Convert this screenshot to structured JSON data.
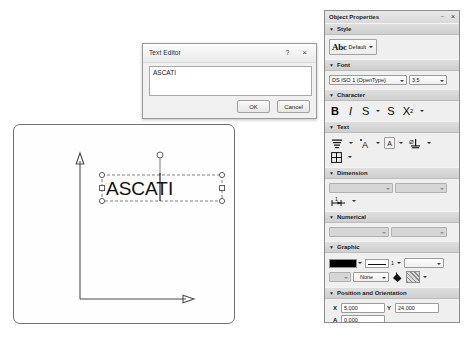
{
  "canvas": {
    "name": "drawing-canvas",
    "text_object": "ASCATI",
    "axis_x_label": "",
    "axis_y_label": "",
    "selection": "text-selection-box"
  },
  "dialog": {
    "title": "Text Editor",
    "help_label": "?",
    "close_label": "×",
    "text_value": "ASCATI",
    "placeholder": "",
    "ok_label": "OK",
    "cancel_label": "Cancel"
  },
  "panel": {
    "title": "Object Properties",
    "pin_label": "–",
    "close_label": "×",
    "sections": {
      "style": {
        "label": "Style",
        "triangle": "▼",
        "preview_glyph": "Abc",
        "value": "Default"
      },
      "font": {
        "label": "Font",
        "triangle": "▼",
        "family": "DS ISO 1 (OpenType)",
        "size": "3.5"
      },
      "character": {
        "label": "Character",
        "triangle": "▼",
        "bold": "B",
        "italic": "I",
        "strike": "S",
        "underline": "S",
        "superscript_base": "X",
        "superscript_exp": "2"
      },
      "text": {
        "label": "Text",
        "triangle": "▼",
        "align_icon": "text-align-icon",
        "letter_a1": "A",
        "letter_a2": "A",
        "anchor_icon": "text-anchor-icon",
        "table_icon": "text-grid-icon"
      },
      "dimension": {
        "label": "Dimension",
        "triangle": "▼",
        "combo1": "",
        "combo2": "",
        "tool_icon": "dimension-style-icon"
      },
      "numerical": {
        "label": "Numerical",
        "triangle": "▼",
        "combo1": "",
        "combo2": ""
      },
      "graphic": {
        "label": "Graphic",
        "triangle": "▼",
        "color": "#000000",
        "line_width": "1",
        "line_style": "",
        "pattern_combo": "",
        "fill_value": "None",
        "hatch": "hatch-pattern-swatch"
      },
      "position": {
        "label": "Position and Orientation",
        "triangle": "▼",
        "x_label": "X",
        "x_value": "5,000",
        "y_label": "Y",
        "y_value": "24,000",
        "a_label": "A",
        "a_value": "0,000"
      }
    }
  }
}
